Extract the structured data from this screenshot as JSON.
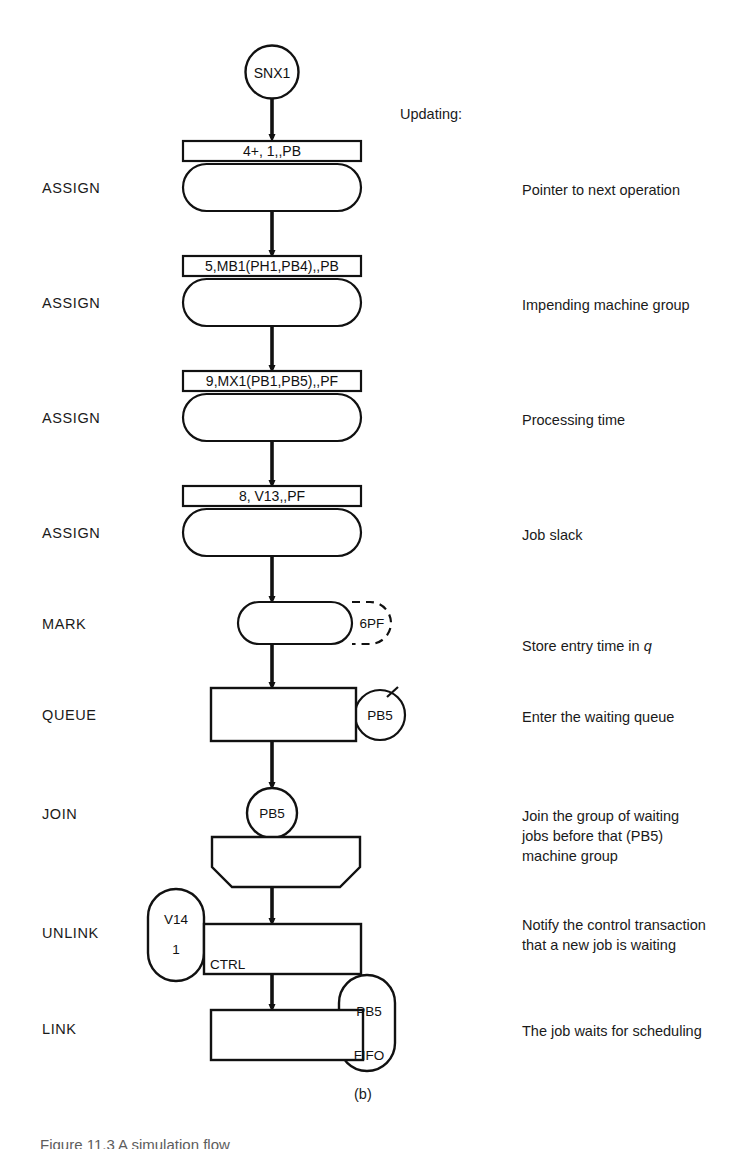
{
  "figure": {
    "caption": "(b)",
    "heading": "Updating:",
    "bottom_text": "Figure 11.3  A simulation flow"
  },
  "start_node": {
    "label": "SNX1"
  },
  "blocks": [
    {
      "type": "ASSIGN",
      "operand": "4+, 1,,PB",
      "annotation": "Pointer to next operation"
    },
    {
      "type": "ASSIGN",
      "operand": "5,MB1(PH1,PB4),,PB",
      "annotation": "Impending machine group"
    },
    {
      "type": "ASSIGN",
      "operand": "9,MX1(PB1,PB5),,PF",
      "annotation": "Processing time"
    },
    {
      "type": "ASSIGN",
      "operand": "8, V13,,PF",
      "annotation": "Job slack"
    },
    {
      "type": "MARK",
      "operand": "6PF",
      "annotation": "Store entry time in q",
      "annotation_italic_tail": "q"
    },
    {
      "type": "QUEUE",
      "operand": "PB5",
      "annotation": "Enter the waiting queue"
    },
    {
      "type": "JOIN",
      "operand": "PB5",
      "annotation": "Join the group of waiting\njobs before that (PB5)\nmachine group"
    },
    {
      "type": "UNLINK",
      "operand_a": "V14",
      "operand_b": "1",
      "operand_c": "CTRL",
      "annotation": "Notify the control transaction\nthat a new job is waiting"
    },
    {
      "type": "LINK",
      "operand_a": "PB5",
      "operand_b": "FIFO",
      "annotation": "The job waits for scheduling"
    }
  ],
  "colors": {
    "line": "#111111",
    "text": "#1a1a1a",
    "background": "#ffffff"
  }
}
